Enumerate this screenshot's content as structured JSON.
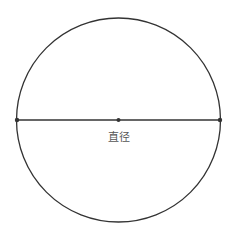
{
  "diagram": {
    "title": "",
    "circle": {
      "cx": 118.5,
      "cy": 120,
      "r": 102,
      "stroke": "#333333"
    },
    "diameter": {
      "x1": 17,
      "x2": 220,
      "y": 120,
      "stroke": "#333333"
    },
    "points": [
      {
        "name": "left-endpoint",
        "x": 17,
        "y": 120
      },
      {
        "name": "center",
        "x": 118.5,
        "y": 120
      },
      {
        "name": "right-endpoint",
        "x": 220,
        "y": 120
      }
    ],
    "label": "直径"
  }
}
